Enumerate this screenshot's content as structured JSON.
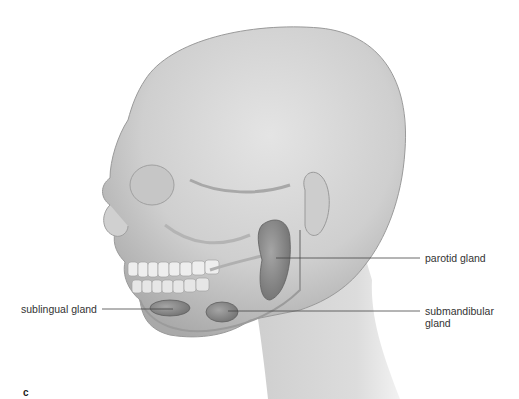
{
  "figure": {
    "panel_letter": "c",
    "labels": [
      {
        "id": "parotid",
        "text": "parotid gland"
      },
      {
        "id": "sublingual",
        "text": "sublingual gland"
      },
      {
        "id": "submandibular_line1",
        "text": "submandibular"
      },
      {
        "id": "submandibular_line2",
        "text": "gland"
      }
    ]
  },
  "colors": {
    "background": "#ffffff",
    "skin": "#d4d4d4",
    "gland": "#8a8a8a",
    "leader_line": "#444444"
  }
}
